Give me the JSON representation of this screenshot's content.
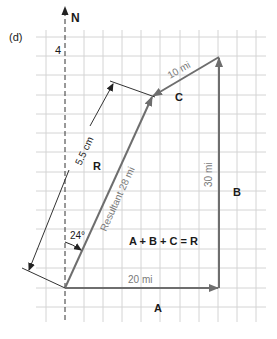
{
  "figure": {
    "panel_label": "(d)",
    "north_label": "N",
    "grid_label": "4",
    "grid": {
      "x_lines": [
        46,
        65,
        84,
        103,
        122,
        141,
        160,
        180,
        199,
        218,
        237,
        256
      ],
      "y_lines": [
        37,
        56,
        75,
        95,
        114,
        133,
        152,
        172,
        191,
        210,
        229,
        249,
        268,
        288,
        307
      ],
      "color": "#d4d4d4"
    },
    "colors": {
      "vector": "#6e6e6e",
      "text": "#1a1a1a",
      "label_gray": "#7a7a7a"
    },
    "vectors": {
      "A": {
        "label": "A",
        "magnitude_label": "20 mi"
      },
      "B": {
        "label": "B",
        "magnitude_label": "30 mi"
      },
      "C": {
        "label": "C",
        "magnitude_label": "10 mi"
      },
      "R": {
        "label": "R",
        "magnitude_label": "Resultant 28 mi"
      }
    },
    "measurement_label": "5.5 cm",
    "angle_label": "24°",
    "equation": "A + B + C = R"
  }
}
